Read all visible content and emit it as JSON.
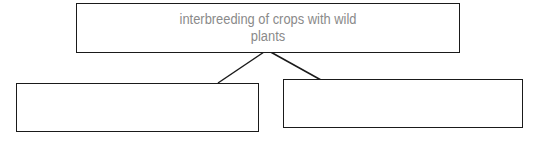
{
  "diagram": {
    "root": {
      "label": "interbreeding of crops with wild plants"
    },
    "children": [
      {
        "label": ""
      },
      {
        "label": ""
      }
    ],
    "colors": {
      "border": "#1a1a1a",
      "text": "#8a8a8a",
      "background": "#ffffff"
    }
  }
}
